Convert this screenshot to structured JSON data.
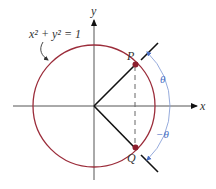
{
  "diagram": {
    "equation_label": "x² + y² = 1",
    "x_axis_label": "x",
    "y_axis_label": "y",
    "point_p_label": "P",
    "point_q_label": "Q",
    "angle_pos_label": "θ",
    "angle_neg_label": "−θ",
    "colors": {
      "circle": "#9b2c3a",
      "axes": "#555555",
      "rays": "#111111",
      "angle_arc": "#4a6fc4",
      "points": "#8c1f2e"
    }
  }
}
